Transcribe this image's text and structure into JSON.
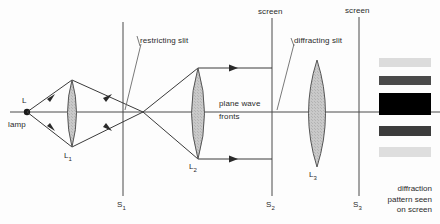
{
  "figure": {
    "type": "optics-ray-diagram",
    "background": "#fdfdfd",
    "stroke": "#3a3a3a",
    "lens_fill": "#c9c9c9"
  },
  "labels": {
    "source_letter": "L",
    "lamp": "lamp",
    "lens1": "L",
    "lens1_sub": "1",
    "lens2": "L",
    "lens2_sub": "2",
    "lens3": "L",
    "lens3_sub": "3",
    "restricting_slit": "restricting slit",
    "diffracting_slit": "diffracting slit",
    "plane_wave_line1": "plane wave",
    "plane_wave_line2": "fronts",
    "screen_top_1": "screen",
    "screen_top_2": "screen",
    "screen1": "S",
    "screen1_sub": "1",
    "screen2": "S",
    "screen2_sub": "2",
    "screen3": "S",
    "screen3_sub": "3",
    "caption_line1": "diffraction",
    "caption_line2": "pattern seen",
    "caption_line3": "on screen"
  },
  "pattern": {
    "name": "diffraction-pattern",
    "bands": [
      {
        "label": "outer-faint-upper",
        "x": 379,
        "y": 58,
        "width": 52,
        "height": 9,
        "color": "#dcdcdc"
      },
      {
        "label": "secondary-upper",
        "x": 379,
        "y": 76,
        "width": 52,
        "height": 9,
        "color": "#4a4a4a"
      },
      {
        "label": "central-maximum",
        "x": 379,
        "y": 93,
        "width": 52,
        "height": 22,
        "color": "#000000"
      },
      {
        "label": "secondary-lower",
        "x": 379,
        "y": 126,
        "width": 52,
        "height": 10,
        "color": "#3c3c3c"
      },
      {
        "label": "outer-faint-lower",
        "x": 379,
        "y": 147,
        "width": 52,
        "height": 10,
        "color": "#dedede"
      }
    ]
  },
  "optics": {
    "axis_y": 112,
    "source_x": 27,
    "focus_x": 143,
    "lenses": [
      {
        "name": "L1",
        "cx": 72,
        "top": 80,
        "bottom": 147,
        "halfwidth": 9
      },
      {
        "name": "L2",
        "cx": 198,
        "top": 68,
        "bottom": 159,
        "halfwidth": 13
      },
      {
        "name": "L3",
        "cx": 317,
        "top": 60,
        "bottom": 167,
        "halfwidth": 17
      }
    ],
    "screens": [
      {
        "name": "S1",
        "x": 123,
        "top": 22,
        "bottom": 196
      },
      {
        "name": "S2",
        "x": 272,
        "top": 27,
        "bottom": 196
      },
      {
        "name": "S3",
        "x": 359,
        "top": 24,
        "bottom": 196
      }
    ],
    "parallel_rays_y": [
      68,
      159
    ]
  }
}
